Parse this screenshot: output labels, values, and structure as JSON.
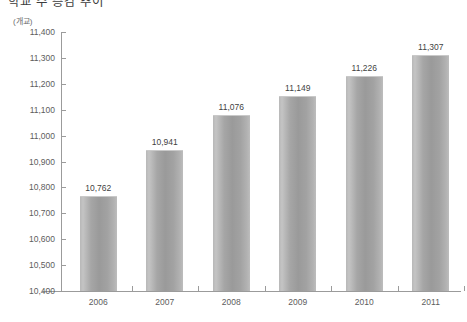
{
  "chart_title": "학교 수 증감 추이",
  "unit_label": "(개교)",
  "chart_data": {
    "type": "bar",
    "title": "학교 수 증감 추이",
    "unit": "(개교)",
    "xlabel": "",
    "ylabel": "",
    "ylim": [
      10400,
      11400
    ],
    "ytick_step": 100,
    "grid": false,
    "legend": false,
    "categories": [
      "2006",
      "2007",
      "2008",
      "2009",
      "2010",
      "2011"
    ],
    "values": [
      10762,
      10941,
      11076,
      11149,
      11226,
      11307
    ],
    "value_labels": [
      "10,762",
      "10,941",
      "11,076",
      "11,149",
      "11,226",
      "11,307"
    ],
    "ytick_labels": [
      "11,400",
      "11,300",
      "11,200",
      "11,100",
      "11,000",
      "10,900",
      "10,800",
      "10,700",
      "10,600",
      "10,500",
      "10,400"
    ],
    "ytick_values": [
      11400,
      11300,
      11200,
      11100,
      11000,
      10900,
      10800,
      10700,
      10600,
      10500,
      10400
    ],
    "bar_color": "#a6a6a6",
    "axis_color": "#9b9b9b",
    "text_color": "#5d5d5d"
  }
}
